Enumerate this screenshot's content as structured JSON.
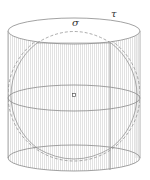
{
  "figure": {
    "title": "",
    "labels": {
      "sigma": "σ",
      "tau": "τ"
    },
    "geometry": {
      "cylinder": {
        "cx": 74,
        "left": 8,
        "right": 140,
        "top_cy": 31,
        "mid_cy": 98,
        "bottom_cy": 158,
        "ry": 13
      },
      "sphere": {
        "cx": 74,
        "cy": 95,
        "r": 66
      },
      "center_point": {
        "x": 74,
        "y": 95
      },
      "vertical_line_x": 110
    },
    "colors": {
      "stroke": "#8a8a8a",
      "hatch": "#c8c8c8",
      "dashed": "#888888"
    }
  }
}
